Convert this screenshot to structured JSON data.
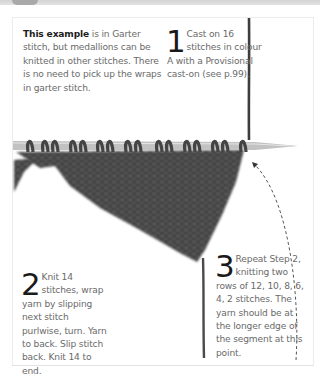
{
  "note": {
    "bold": "This example",
    "text": " is in Garter stitch, but medallions can be knitted in other stitches. There is no need to pick up the wraps in garter stitch."
  },
  "steps": [
    {
      "number": "1",
      "text": "Cast on 16 stitches in colour A with a Provisional cast-on (see p.99)."
    },
    {
      "number": "2",
      "text": "Knit 14 stitches, wrap yarn by slipping next stitch purlwise, turn. Yarn to back. Slip stitch back. Knit 14 to end."
    },
    {
      "number": "3",
      "text": "Repeat Step 2, knitting two rows of 12, 10, 8, 6, 4, 2 stitches. The yarn should be at the longer edge of the segment at this point."
    }
  ],
  "illustration": {
    "subject": "knitted garter-stitch triangle on needle",
    "yarn_color": "#3c3c3c",
    "needle_color": "#bdbdbd",
    "arrow": "dashed curved arrow pointing to right end of needle"
  }
}
